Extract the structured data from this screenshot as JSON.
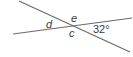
{
  "diagram": {
    "type": "intersecting-lines",
    "line_color": "#6a6a6a",
    "lines": [
      {
        "name": "line-1",
        "x1": 19,
        "y1": 1,
        "x2": 130,
        "y2": 52
      },
      {
        "name": "line-2",
        "x1": 13,
        "y1": 34,
        "x2": 132,
        "y2": 18
      }
    ],
    "intersection": {
      "x": 73,
      "y": 26
    },
    "labels": {
      "d": "d",
      "e": "e",
      "c": "c",
      "given_angle": "32°"
    }
  }
}
